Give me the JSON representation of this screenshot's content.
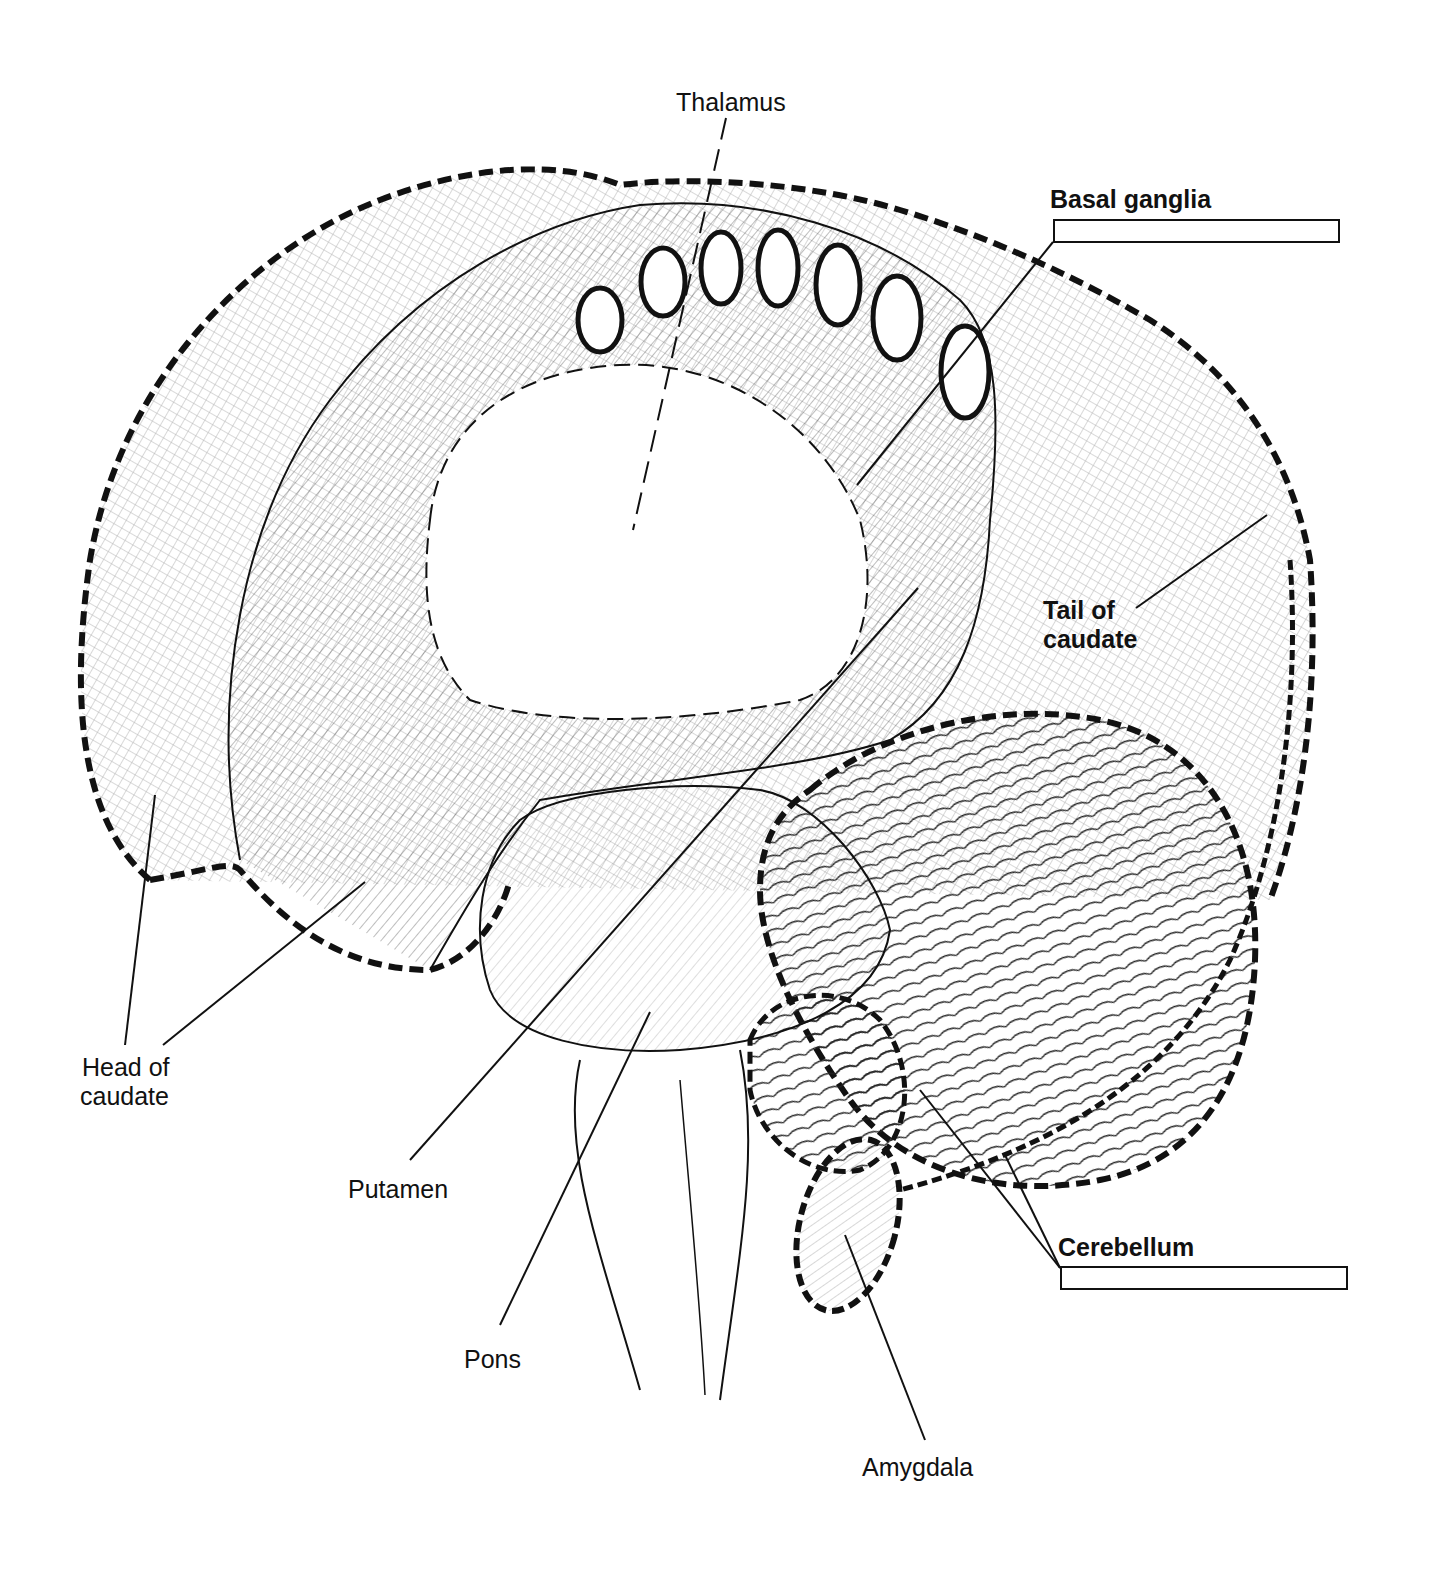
{
  "figure": {
    "labels": [
      {
        "id": "thalamus",
        "text": "Thalamus",
        "bold": false
      },
      {
        "id": "basal_ganglia",
        "text": "Basal ganglia",
        "bold": true
      },
      {
        "id": "tail_of_caudate_1",
        "text": "Tail of",
        "bold": true
      },
      {
        "id": "tail_of_caudate_2",
        "text": "caudate",
        "bold": true
      },
      {
        "id": "head_of_caudate_1",
        "text": "Head of",
        "bold": false
      },
      {
        "id": "head_of_caudate_2",
        "text": "caudate",
        "bold": false
      },
      {
        "id": "putamen",
        "text": "Putamen",
        "bold": false
      },
      {
        "id": "pons",
        "text": "Pons",
        "bold": false
      },
      {
        "id": "cerebellum",
        "text": "Cerebellum",
        "bold": true
      },
      {
        "id": "amygdala",
        "text": "Amygdala",
        "bold": false
      }
    ],
    "answer_boxes": [
      {
        "for": "basal_ganglia",
        "value": ""
      },
      {
        "for": "cerebellum",
        "value": ""
      }
    ]
  }
}
